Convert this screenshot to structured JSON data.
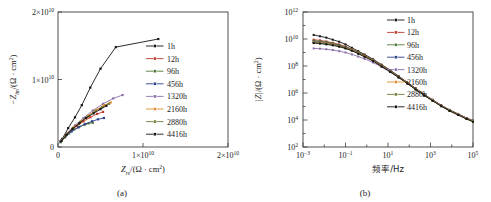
{
  "figure": {
    "panels": [
      "a",
      "b"
    ]
  },
  "panel_a": {
    "caption": "(a)",
    "legend_labels": [
      "1h",
      "12h",
      "96h",
      "456h",
      "1320h",
      "2160h",
      "2880h",
      "4416h"
    ]
  },
  "panel_b": {
    "caption": "(b)",
    "legend_labels": [
      "1h",
      "12h",
      "96h",
      "456h",
      "1320h",
      "2160h",
      "2880h",
      "4416h"
    ]
  },
  "colors": {
    "series": [
      "#141414",
      "#c0392b",
      "#4f7a35",
      "#2b3f8c",
      "#8a6fa8",
      "#e08c2e",
      "#6f7b33",
      "#141414"
    ],
    "axis": "#3c3c3c",
    "text": "#1a1a1a",
    "background": "#ffffff"
  },
  "chart_data": [
    {
      "type": "scatter",
      "panel": "a",
      "title": "",
      "xlabel": "Z_re/(Ω · cm²)",
      "ylabel": "−Z_im/(Ω · cm²)",
      "xlabel_parts": {
        "symbol": "Z",
        "subscript": "re",
        "units": "/(Ω · cm",
        "unit_sup": "2",
        "tail": ")"
      },
      "ylabel_parts": {
        "prefix": "−",
        "symbol": "Z",
        "subscript": "im",
        "units": "/(Ω · cm",
        "unit_sup": "2",
        "tail": ")"
      },
      "xlim": [
        0,
        20000000000.0
      ],
      "ylim": [
        0,
        20000000000.0
      ],
      "grid": false,
      "scale": "linear",
      "xticks": [
        0,
        10000000000.0,
        20000000000.0
      ],
      "xtick_labels": [
        "0",
        "1×10¹⁰",
        "2×10¹⁰"
      ],
      "yticks": [
        0,
        10000000000.0,
        20000000000.0
      ],
      "ytick_labels": [
        "0",
        "1×10¹⁰",
        "2×10¹⁰"
      ],
      "tick_mantissas": [
        "0",
        "1",
        "2"
      ],
      "tick_exponent": "10",
      "tick_exponent_sup": "10",
      "legend_position": "right-center",
      "series": [
        {
          "name": "1h",
          "color": "#141414",
          "x": [
            500000000.0,
            1200000000.0,
            2000000000.0,
            2800000000.0,
            3800000000.0,
            5000000000.0,
            6800000000.0,
            11800000000.0
          ],
          "y": [
            1200000000.0,
            2800000000.0,
            4400000000.0,
            6200000000.0,
            8800000000.0,
            11600000000.0,
            14800000000.0,
            16000000000.0
          ]
        },
        {
          "name": "12h",
          "color": "#c0392b",
          "x": [
            300000000.0,
            900000000.0,
            1500000000.0,
            2200000000.0,
            3000000000.0,
            3800000000.0,
            4600000000.0,
            5300000000.0
          ],
          "y": [
            800000000.0,
            1700000000.0,
            2400000000.0,
            3100000000.0,
            3800000000.0,
            4400000000.0,
            4900000000.0,
            5200000000.0
          ]
        },
        {
          "name": "96h",
          "color": "#4f7a35",
          "x": [
            300000000.0,
            800000000.0,
            1300000000.0,
            1900000000.0,
            2500000000.0,
            3100000000.0,
            3600000000.0,
            4100000000.0
          ],
          "y": [
            700000000.0,
            1400000000.0,
            2000000000.0,
            2600000000.0,
            3000000000.0,
            3300000000.0,
            3500000000.0,
            3600000000.0
          ]
        },
        {
          "name": "456h",
          "color": "#2b3f8c",
          "x": [
            300000000.0,
            900000000.0,
            1600000000.0,
            2400000000.0,
            3200000000.0,
            4000000000.0,
            4700000000.0,
            5400000000.0
          ],
          "y": [
            800000000.0,
            1600000000.0,
            2300000000.0,
            2900000000.0,
            3400000000.0,
            3800000000.0,
            4100000000.0,
            4300000000.0
          ]
        },
        {
          "name": "1320h",
          "color": "#8a6fa8",
          "x": [
            400000000.0,
            1100000000.0,
            2000000000.0,
            3000000000.0,
            4100000000.0,
            5300000000.0,
            6500000000.0,
            7600000000.0
          ],
          "y": [
            1000000000.0,
            2100000000.0,
            3200000000.0,
            4300000000.0,
            5400000000.0,
            6400000000.0,
            7200000000.0,
            7700000000.0
          ]
        },
        {
          "name": "2160h",
          "color": "#e08c2e",
          "x": [
            400000000.0,
            1000000000.0,
            1800000000.0,
            2700000000.0,
            3600000000.0,
            4500000000.0,
            5400000000.0,
            6200000000.0
          ],
          "y": [
            900000000.0,
            1900000000.0,
            2900000000.0,
            3800000000.0,
            4700000000.0,
            5500000000.0,
            6200000000.0,
            6600000000.0
          ]
        },
        {
          "name": "2880h",
          "color": "#6f7b33",
          "x": [
            400000000.0,
            1000000000.0,
            1800000000.0,
            2600000000.0,
            3500000000.0,
            4400000000.0,
            5200000000.0,
            6000000000.0
          ],
          "y": [
            900000000.0,
            1900000000.0,
            2800000000.0,
            3700000000.0,
            4500000000.0,
            5300000000.0,
            5900000000.0,
            6400000000.0
          ]
        },
        {
          "name": "4416h",
          "color": "#141414",
          "x": [
            400000000.0,
            1000000000.0,
            1700000000.0,
            2500000000.0,
            3300000000.0,
            4200000000.0,
            5000000000.0,
            5700000000.0
          ],
          "y": [
            900000000.0,
            1800000000.0,
            2700000000.0,
            3500000000.0,
            4300000000.0,
            5000000000.0,
            5600000000.0,
            6100000000.0
          ]
        }
      ]
    },
    {
      "type": "line",
      "panel": "b",
      "title": "",
      "xlabel": "频率/Hz",
      "ylabel": "|Z|/(Ω · cm²)",
      "ylabel_parts": {
        "symbol": "|Z|",
        "units": "/(Ω · cm",
        "unit_sup": "2",
        "tail": ")"
      },
      "xlim": [
        -3,
        5
      ],
      "ylim": [
        2,
        12
      ],
      "grid": false,
      "scale": "log-log",
      "xtick_exponents": [
        -3,
        -1,
        1,
        3,
        5
      ],
      "xtick_labels": [
        "10⁻³",
        "10⁻¹",
        "10¹",
        "10³",
        "10⁵"
      ],
      "ytick_exponents": [
        2,
        4,
        6,
        8,
        10,
        12
      ],
      "ytick_labels": [
        "10²",
        "10⁴",
        "10⁶",
        "10⁸",
        "10¹⁰",
        "10¹²"
      ],
      "legend_position": "top-right",
      "x_log": [
        -2.5,
        -2.2,
        -1.9,
        -1.6,
        -1.3,
        -1.0,
        -0.7,
        -0.4,
        -0.1,
        0.3,
        0.7,
        1.1,
        1.5,
        1.9,
        2.3,
        2.7,
        3.1,
        3.5,
        3.9,
        4.3,
        4.7,
        5.0
      ],
      "series": [
        {
          "name": "1h",
          "color": "#141414",
          "y_log": [
            10.3,
            10.2,
            10.1,
            9.95,
            9.8,
            9.6,
            9.35,
            9.1,
            8.85,
            8.5,
            8.1,
            7.7,
            7.25,
            6.8,
            6.35,
            5.9,
            5.5,
            5.1,
            4.75,
            4.45,
            4.15,
            3.95
          ]
        },
        {
          "name": "12h",
          "color": "#c0392b",
          "y_log": [
            9.95,
            9.9,
            9.82,
            9.72,
            9.6,
            9.45,
            9.25,
            9.02,
            8.78,
            8.45,
            8.05,
            7.65,
            7.22,
            6.78,
            6.32,
            5.88,
            5.48,
            5.08,
            4.73,
            4.43,
            4.13,
            3.93
          ]
        },
        {
          "name": "96h",
          "color": "#4f7a35",
          "y_log": [
            9.88,
            9.84,
            9.77,
            9.68,
            9.56,
            9.41,
            9.22,
            9.0,
            8.76,
            8.43,
            8.03,
            7.63,
            7.2,
            6.76,
            6.3,
            5.86,
            5.46,
            5.06,
            4.71,
            4.41,
            4.11,
            3.91
          ]
        },
        {
          "name": "456h",
          "color": "#2b3f8c",
          "y_log": [
            9.82,
            9.78,
            9.72,
            9.63,
            9.52,
            9.38,
            9.19,
            8.97,
            8.74,
            8.41,
            8.01,
            7.61,
            7.18,
            6.74,
            6.29,
            5.85,
            5.45,
            5.05,
            4.7,
            4.4,
            4.1,
            3.9
          ]
        },
        {
          "name": "1320h",
          "color": "#8a6fa8",
          "y_log": [
            9.3,
            9.28,
            9.24,
            9.18,
            9.1,
            9.0,
            8.86,
            8.7,
            8.52,
            8.26,
            7.92,
            7.55,
            7.15,
            6.72,
            6.28,
            5.84,
            5.44,
            5.04,
            4.69,
            4.39,
            4.09,
            3.89
          ]
        },
        {
          "name": "2160h",
          "color": "#e08c2e",
          "y_log": [
            9.78,
            9.74,
            9.68,
            9.6,
            9.49,
            9.35,
            9.17,
            8.95,
            8.72,
            8.4,
            8.0,
            7.6,
            7.17,
            6.73,
            6.28,
            5.84,
            5.44,
            5.04,
            4.69,
            4.39,
            4.09,
            3.89
          ]
        },
        {
          "name": "2880h",
          "color": "#6f7b33",
          "y_log": [
            9.74,
            9.7,
            9.64,
            9.57,
            9.46,
            9.32,
            9.15,
            8.93,
            8.7,
            8.38,
            7.98,
            7.58,
            7.16,
            6.72,
            6.27,
            5.83,
            5.43,
            5.03,
            4.68,
            4.38,
            4.08,
            3.88
          ]
        },
        {
          "name": "4416h",
          "color": "#141414",
          "y_log": [
            9.7,
            9.66,
            9.6,
            9.53,
            9.43,
            9.3,
            9.13,
            8.91,
            8.68,
            8.36,
            7.96,
            7.57,
            7.15,
            6.71,
            6.26,
            5.82,
            5.42,
            5.02,
            4.67,
            4.37,
            4.07,
            3.87
          ]
        }
      ]
    }
  ]
}
